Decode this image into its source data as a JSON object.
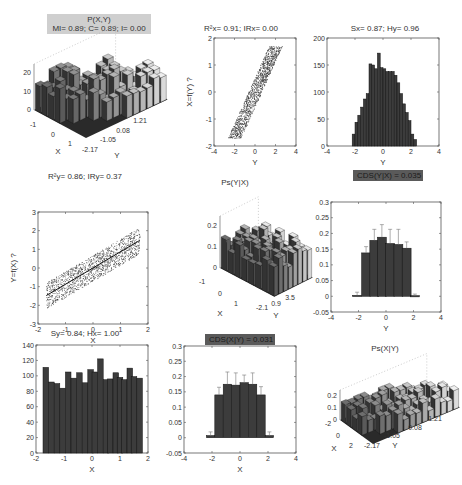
{
  "panels": {
    "p1": {
      "title_line1": "P(X,Y)",
      "title_line2": "MI= 0.89; C= 0.89; I= 0.00"
    },
    "p2": {
      "title": "R²x= 0.91; IRx= 0.00",
      "ylabel": "X=f(Y) ?",
      "xlabel": "Y"
    },
    "p3": {
      "title": "Sx= 0.87; Hy= 0.96",
      "xlabel": "Y"
    },
    "p4": {
      "title": "R²y= 0.86; IRy= 0.37",
      "ylabel": "Y=f(X) ?",
      "xlabel": "X"
    },
    "p5": {
      "title": "Ps(Y|X)"
    },
    "p6": {
      "title": "CDS(Y|X) = 0.035",
      "xlabel": "Y"
    },
    "p7": {
      "title": "Sy= 0.84; Hx= 1.00",
      "xlabel": "X"
    },
    "p8": {
      "title": "CDS(X|Y) = 0.031",
      "xlabel": "X"
    },
    "p9": {
      "title": "Ps(X|Y)"
    }
  },
  "chart_data": [
    {
      "id": "p1",
      "type": "bar3d",
      "title": "P(X,Y) — MI= 0.89; C= 0.89; I= 0.00",
      "xlabel": "X",
      "ylabel": "Y",
      "x_ticks": [
        "-1",
        "0",
        "1"
      ],
      "y_ticks": [
        "-2.17",
        "-1.05",
        "0.08",
        "1.21"
      ],
      "z_ticks": [
        "0",
        "10",
        "20"
      ],
      "zlim": [
        0,
        25
      ]
    },
    {
      "id": "p2",
      "type": "scatter",
      "title": "R²x= 0.91; IRx= 0.00",
      "xlabel": "Y",
      "ylabel": "X=f(Y) ?",
      "xlim": [
        -4,
        4
      ],
      "ylim": [
        -2,
        2
      ],
      "x_ticks": [
        -4,
        -2,
        0,
        2,
        4
      ],
      "y_ticks": [
        -2,
        -1,
        0,
        1,
        2
      ],
      "description": "dense band rising from (-2,-1.7) to (2,1.7)"
    },
    {
      "id": "p3",
      "type": "bar",
      "title": "Sx= 0.87; Hy= 0.96",
      "xlabel": "Y",
      "ylabel": "",
      "xlim": [
        -4,
        4
      ],
      "ylim": [
        0,
        200
      ],
      "x_ticks": [
        -4,
        -2,
        0,
        2,
        4
      ],
      "y_ticks": [
        0,
        50,
        100,
        150,
        200
      ],
      "x": [
        -2.1,
        -1.9,
        -1.7,
        -1.5,
        -1.3,
        -1.1,
        -0.9,
        -0.7,
        -0.5,
        -0.3,
        -0.1,
        0.1,
        0.3,
        0.5,
        0.7,
        0.9,
        1.1,
        1.3,
        1.5,
        1.7,
        1.9,
        2.1,
        2.3
      ],
      "values": [
        22,
        44,
        57,
        72,
        87,
        97,
        152,
        150,
        143,
        172,
        145,
        143,
        138,
        138,
        138,
        131,
        117,
        97,
        78,
        62,
        47,
        22,
        12
      ]
    },
    {
      "id": "p4",
      "type": "scatter",
      "title": "R²y= 0.86; IRy= 0.37",
      "xlabel": "X",
      "ylabel": "Y=f(X) ?",
      "xlim": [
        -2,
        2
      ],
      "ylim": [
        -3,
        3
      ],
      "x_ticks": [
        -2,
        -1,
        0,
        1,
        2
      ],
      "y_ticks": [
        -3,
        -2,
        -1,
        0,
        1,
        2,
        3
      ],
      "description": "dense band rising from (-1.7,-1.5) to (1.7,1.5) with fitted line"
    },
    {
      "id": "p5",
      "type": "bar3d",
      "title": "Ps(Y|X)",
      "xlabel": "X",
      "ylabel": "Y",
      "x_ticks": [
        "-1",
        "0",
        "1"
      ],
      "y_ticks": [
        "-2.1",
        "0.9",
        "3.5"
      ],
      "z_ticks": [
        "0",
        "0.1",
        "0.2"
      ]
    },
    {
      "id": "p6",
      "type": "bar",
      "title": "CDS(Y|X) = 0.035",
      "xlabel": "Y",
      "xlim": [
        -4,
        4
      ],
      "ylim": [
        -0.05,
        0.3
      ],
      "x_ticks": [
        -4,
        -2,
        0,
        2,
        4
      ],
      "y_ticks": [
        -0.05,
        0,
        0.05,
        0.1,
        0.15,
        0.2,
        0.25,
        0.3
      ],
      "x": [
        -2.1,
        -1.45,
        -0.85,
        -0.3,
        0.3,
        0.9,
        1.5,
        2.1
      ],
      "values": [
        0.003,
        0.138,
        0.178,
        0.188,
        0.168,
        0.165,
        0.153,
        0.002
      ],
      "errors": [
        0.01,
        0.02,
        0.035,
        0.04,
        0.045,
        0.048,
        0.02,
        0.005
      ]
    },
    {
      "id": "p7",
      "type": "bar",
      "title": "Sy= 0.84; Hx= 1.00",
      "xlabel": "X",
      "xlim": [
        -2,
        2
      ],
      "ylim": [
        0,
        140
      ],
      "x_ticks": [
        -2,
        -1,
        0,
        1,
        2
      ],
      "y_ticks": [
        0,
        20,
        40,
        60,
        80,
        100,
        120,
        140
      ],
      "x": [
        -1.65,
        -1.45,
        -1.25,
        -1.05,
        -0.85,
        -0.65,
        -0.45,
        -0.25,
        -0.05,
        0.1,
        0.3,
        0.5,
        0.65,
        0.85,
        1.0,
        1.15,
        1.35,
        1.5,
        1.7
      ],
      "values": [
        111,
        92,
        90,
        84,
        105,
        97,
        104,
        91,
        108,
        105,
        122,
        95,
        96,
        104,
        98,
        95,
        110,
        99,
        97
      ]
    },
    {
      "id": "p8",
      "type": "bar",
      "title": "CDS(X|Y) = 0.031",
      "xlabel": "X",
      "xlim": [
        -4,
        4
      ],
      "ylim": [
        -0.05,
        0.3
      ],
      "x_ticks": [
        -4,
        -2,
        0,
        2,
        4
      ],
      "y_ticks": [
        -0.05,
        0,
        0.05,
        0.1,
        0.15,
        0.2,
        0.25,
        0.3
      ],
      "x": [
        -2.1,
        -1.5,
        -0.9,
        -0.3,
        0.3,
        0.9,
        1.5,
        2.1
      ],
      "values": [
        0.007,
        0.14,
        0.175,
        0.172,
        0.18,
        0.175,
        0.14,
        0.007
      ],
      "errors": [
        0.012,
        0.025,
        0.04,
        0.04,
        0.025,
        0.037,
        0.027,
        0.012
      ]
    },
    {
      "id": "p9",
      "type": "bar3d",
      "title": "Ps(X|Y)",
      "xlabel": "X",
      "ylabel": "Y",
      "x_ticks": [
        "-2",
        "0",
        "2"
      ],
      "y_ticks": [
        "-2.17",
        "-1.05",
        "0.08",
        "1.21"
      ],
      "z_ticks": [
        "0",
        "0.1",
        "0.2"
      ]
    }
  ]
}
